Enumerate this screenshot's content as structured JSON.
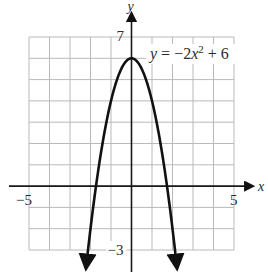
{
  "chart_data": {
    "type": "line",
    "title": "",
    "equation": "y = −2x² + 6",
    "equation_parts": {
      "lhs": "y",
      "eq": "=",
      "coef": "−2",
      "var": "x",
      "exp": "2",
      "tail": "+ 6"
    },
    "function": {
      "a": -2,
      "b": 0,
      "c": 6
    },
    "xlabel": "x",
    "ylabel": "y",
    "xlim": [
      -5,
      5
    ],
    "ylim": [
      -3,
      7
    ],
    "x_tick_labels": [
      {
        "value": -5,
        "label": "−5"
      },
      {
        "value": 5,
        "label": "5"
      }
    ],
    "y_tick_labels": [
      {
        "value": 7,
        "label": "7"
      },
      {
        "value": -3,
        "label": "−3"
      }
    ],
    "grid": true,
    "grid_step": 1,
    "vertex": [
      0,
      6
    ],
    "x_intercepts": [
      -1.732,
      1.732
    ],
    "arrows_on_ends": true,
    "line_color": "#111111",
    "grid_color": "#b9b9b9",
    "axis_color": "#1a1a1a"
  }
}
